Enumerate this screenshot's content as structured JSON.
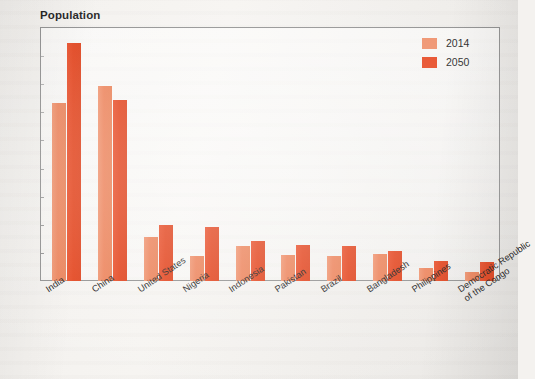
{
  "chart_data": {
    "type": "bar",
    "title": "Population",
    "xlabel": "",
    "ylabel": "",
    "ylim": [
      0,
      1800
    ],
    "y_ticks": [
      0,
      200,
      400,
      600,
      800,
      1000,
      1200,
      1400,
      1600,
      1800
    ],
    "grid": false,
    "legend_position": "top-right",
    "categories": [
      "India",
      "China",
      "United States",
      "Nigeria",
      "Indonesia",
      "Pakistan",
      "Brazil",
      "Bangladesh",
      "Philippines",
      "Democratic Republic\nof the Congo"
    ],
    "series": [
      {
        "name": "2014",
        "color": "#ee8e68",
        "values": [
          1270,
          1390,
          315,
          175,
          250,
          185,
          180,
          190,
          95,
          65
        ]
      },
      {
        "name": "2050",
        "color": "#e6431c",
        "values": [
          1690,
          1290,
          395,
          385,
          285,
          255,
          250,
          210,
          145,
          135
        ]
      }
    ]
  },
  "legend": {
    "items": [
      {
        "label": "2014",
        "color": "#ee8e68"
      },
      {
        "label": "2050",
        "color": "#e6431c"
      }
    ]
  }
}
